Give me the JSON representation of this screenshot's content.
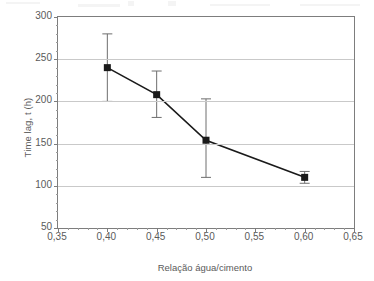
{
  "chart_data": {
    "type": "line",
    "title": "",
    "xlabel": "Relação água/cimento",
    "ylabel": "Time lag, t (h)",
    "xlim": [
      0.35,
      0.65
    ],
    "ylim": [
      50,
      300
    ],
    "grid": true,
    "legend": "none",
    "x_tick_labels": [
      "0,35",
      "0,40",
      "0,45",
      "0,50",
      "0,55",
      "0,60",
      "0,65"
    ],
    "x_tick_values": [
      0.35,
      0.4,
      0.45,
      0.5,
      0.55,
      0.6,
      0.65
    ],
    "y_tick_labels": [
      "50",
      "100",
      "150",
      "200",
      "250",
      "300"
    ],
    "y_tick_values": [
      50,
      100,
      150,
      200,
      250,
      300
    ],
    "x": [
      0.4,
      0.45,
      0.5,
      0.6
    ],
    "values": [
      240,
      208,
      154,
      110
    ],
    "error_upper": [
      280,
      236,
      203,
      117
    ],
    "error_lower": [
      200,
      181,
      110,
      103
    ],
    "marker": "square",
    "marker_color": "#1a1a1a",
    "line_color": "#1a1a1a",
    "errorbar_color": "#6e6e6e",
    "grid_color": "#c9c9c9",
    "axis_color": "#7d7d7d",
    "text_color": "#5a5a5a",
    "background": "#ffffff"
  }
}
